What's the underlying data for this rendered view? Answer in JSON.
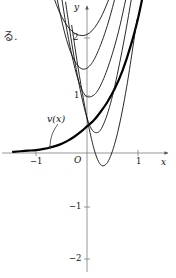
{
  "figure": {
    "side_text": "る.",
    "axis": {
      "x_label": "x",
      "y_label": "y",
      "origin_label": "O",
      "x_ticks": [
        {
          "label": "−1",
          "value": -1
        },
        {
          "label": "1",
          "value": 1
        }
      ],
      "y_ticks": [
        {
          "label": "2",
          "value": 2
        },
        {
          "label": "1",
          "value": 1
        },
        {
          "label": "−1",
          "value": -1
        },
        {
          "label": "−2",
          "value": -2
        }
      ]
    },
    "annotation": {
      "label": "v(x)",
      "arrow": "curved-arrow-down-right"
    },
    "colors": {
      "ink": "#111111",
      "axis": "#8a8a8a",
      "emphasis": "#000000"
    }
  },
  "chart_data": {
    "type": "line",
    "title": "",
    "xlabel": "x",
    "ylabel": "y",
    "xlim": [
      -1.45,
      1.45
    ],
    "ylim": [
      -2.35,
      2.6
    ],
    "grid": false,
    "legend": "none",
    "annotations": [
      {
        "text": "v(x)",
        "x": -0.62,
        "y": 0.78,
        "points_to": {
          "x": -0.78,
          "y": 0.04
        }
      }
    ],
    "series": [
      {
        "name": "v(x)",
        "emphasis": true,
        "width": 2.2,
        "comment": "limit curve, exponential-like e^x, flat on the left, rising on the right",
        "x": [
          -1.45,
          -1.3,
          -1.15,
          -1.0,
          -0.85,
          -0.7,
          -0.55,
          -0.4,
          -0.25,
          -0.1,
          0.0,
          0.12,
          0.25,
          0.4,
          0.55,
          0.7,
          0.85,
          1.0,
          1.15,
          1.3,
          1.45
        ],
        "y": [
          0.02,
          0.03,
          0.04,
          0.05,
          0.07,
          0.1,
          0.14,
          0.2,
          0.28,
          0.38,
          0.46,
          0.55,
          0.69,
          0.88,
          1.12,
          1.43,
          1.83,
          2.32,
          2.95,
          3.75,
          4.76
        ]
      },
      {
        "name": "approximation-1",
        "emphasis": false,
        "width": 0.9,
        "comment": "widest parabola-like curve, minimum near (-0.1, 2.05)",
        "x": [
          -0.95,
          -0.75,
          -0.55,
          -0.35,
          -0.15,
          0.05,
          0.25,
          0.45,
          0.65,
          0.85,
          1.05,
          1.2
        ],
        "y": [
          3.6,
          2.95,
          2.45,
          2.15,
          2.03,
          2.07,
          2.3,
          2.7,
          3.2,
          3.85,
          4.6,
          5.2
        ]
      },
      {
        "name": "approximation-2",
        "emphasis": false,
        "width": 0.9,
        "comment": "minimum near (-0.1, 1.45)",
        "x": [
          -0.7,
          -0.55,
          -0.4,
          -0.25,
          -0.1,
          0.05,
          0.2,
          0.4,
          0.6,
          0.8,
          1.0,
          1.2
        ],
        "y": [
          3.2,
          2.5,
          1.95,
          1.6,
          1.45,
          1.5,
          1.72,
          2.2,
          2.85,
          3.6,
          4.45,
          5.3
        ]
      },
      {
        "name": "approximation-3",
        "emphasis": false,
        "width": 0.9,
        "comment": "minimum near (0.0, 0.95)",
        "x": [
          -0.55,
          -0.42,
          -0.3,
          -0.17,
          -0.04,
          0.1,
          0.24,
          0.42,
          0.62,
          0.82,
          1.02,
          1.2
        ],
        "y": [
          3.0,
          2.25,
          1.7,
          1.25,
          1.0,
          0.98,
          1.12,
          1.5,
          2.1,
          2.9,
          3.85,
          4.8
        ]
      },
      {
        "name": "approximation-4",
        "emphasis": false,
        "width": 0.9,
        "comment": "minimum near (0.12, 0.36)",
        "x": [
          -0.42,
          -0.3,
          -0.18,
          -0.06,
          0.06,
          0.18,
          0.3,
          0.46,
          0.64,
          0.84,
          1.04,
          1.2
        ],
        "y": [
          2.6,
          1.9,
          1.3,
          0.8,
          0.46,
          0.35,
          0.45,
          0.85,
          1.55,
          2.5,
          3.6,
          4.6
        ]
      },
      {
        "name": "approximation-5",
        "emphasis": false,
        "width": 0.9,
        "comment": "lowest minimum near (0.3, -0.22)",
        "x": [
          -0.3,
          -0.18,
          -0.06,
          0.06,
          0.18,
          0.3,
          0.44,
          0.6,
          0.78,
          0.98,
          1.18
        ],
        "y": [
          2.2,
          1.5,
          0.88,
          0.35,
          -0.05,
          -0.22,
          -0.1,
          0.35,
          1.15,
          2.3,
          3.7
        ]
      },
      {
        "name": "secant-line-1",
        "emphasis": false,
        "width": 0.9,
        "comment": "steep near-straight branch crossing the x-axis left of origin",
        "x": [
          -1.0,
          1.25
        ],
        "y": [
          -2.4,
          4.9
        ]
      },
      {
        "name": "secant-line-2",
        "emphasis": false,
        "width": 0.9,
        "comment": "steep near-straight branch, slightly right of secant-line-1",
        "x": [
          -0.72,
          1.35
        ],
        "y": [
          -2.4,
          5.3
        ]
      },
      {
        "name": "secant-line-3",
        "emphasis": false,
        "width": 0.9,
        "comment": "rightmost steep branch descending to the lower right of the y-axis",
        "x": [
          -0.38,
          1.45
        ],
        "y": [
          -2.4,
          5.0
        ]
      }
    ]
  }
}
